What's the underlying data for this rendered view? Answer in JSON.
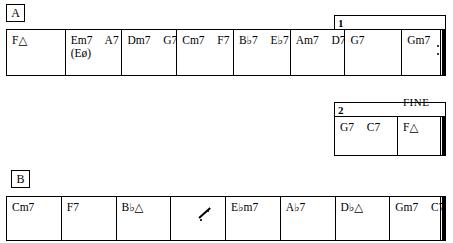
{
  "sections": {
    "a": {
      "rehearsal_letter": "A",
      "measures": [
        {
          "chords": [
            "F△"
          ],
          "second_line": ""
        },
        {
          "chords": [
            "Em7",
            "A7"
          ],
          "second_line": "(Eø)"
        },
        {
          "chords": [
            "Dm7",
            "G7"
          ],
          "second_line": ""
        },
        {
          "chords": [
            "Cm7",
            "F7"
          ],
          "second_line": ""
        },
        {
          "chords": [
            "B♭7",
            "E♭7"
          ],
          "second_line": ""
        },
        {
          "chords": [
            "Am7",
            "D7"
          ],
          "second_line": ""
        },
        {
          "chords": [
            "G7"
          ],
          "second_line": ""
        },
        {
          "chords": [
            "Gm7",
            "C7"
          ],
          "second_line": ""
        }
      ],
      "ending_bar": "end-repeat"
    },
    "ending1": {
      "number": "1"
    },
    "ending2": {
      "number": "2",
      "fine_label": "FINE",
      "measures": [
        {
          "chords": [
            "G7",
            "C7"
          ],
          "second_line": ""
        },
        {
          "chords": [
            "F△"
          ],
          "second_line": ""
        }
      ],
      "ending_bar": "final-double"
    },
    "b": {
      "rehearsal_letter": "B",
      "measures": [
        {
          "chords": [
            "Cm7"
          ],
          "second_line": "",
          "simile": false
        },
        {
          "chords": [
            "F7"
          ],
          "second_line": "",
          "simile": false
        },
        {
          "chords": [
            "B♭△"
          ],
          "second_line": "",
          "simile": false
        },
        {
          "chords": [],
          "second_line": "",
          "simile": true
        },
        {
          "chords": [
            "E♭m7"
          ],
          "second_line": "",
          "simile": false
        },
        {
          "chords": [
            "A♭7"
          ],
          "second_line": "",
          "simile": false
        },
        {
          "chords": [
            "D♭△"
          ],
          "second_line": "",
          "simile": false
        },
        {
          "chords": [
            "Gm7",
            "C7"
          ],
          "second_line": "",
          "simile": false
        }
      ],
      "ending_bar": "final-double"
    }
  },
  "colors": {
    "ink": "#000000",
    "paper": "#ffffff"
  }
}
